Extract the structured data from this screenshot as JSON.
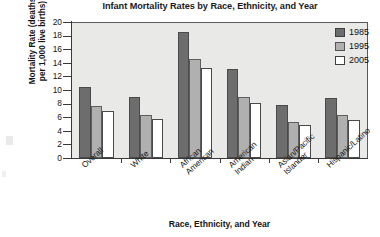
{
  "chart_data": {
    "type": "bar",
    "title": "Infant Mortality Rates by Race, Ethnicity, and Year",
    "xlabel": "Race, Ethnicity, and Year",
    "ylabel": "Mortality Rate (deaths\nper 1,000 live births)",
    "categories": [
      "Overall",
      "White",
      "African\nAmerican",
      "American\nIndian",
      "Asian/Pacific\nIslander",
      "Hispanic/Latino"
    ],
    "series": [
      {
        "name": "1985",
        "color": "#6d6d6d",
        "values": [
          10.4,
          8.9,
          18.6,
          13.1,
          7.8,
          8.8
        ]
      },
      {
        "name": "1995",
        "color": "#b0b0b0",
        "values": [
          7.6,
          6.3,
          14.6,
          9.0,
          5.3,
          6.3
        ]
      },
      {
        "name": "2005",
        "color": "#ffffff",
        "values": [
          6.9,
          5.7,
          13.3,
          8.1,
          4.9,
          5.6
        ]
      }
    ],
    "ylim": [
      0,
      20
    ],
    "yticks": [
      0,
      2,
      4,
      6,
      8,
      10,
      12,
      14,
      16,
      18,
      20
    ],
    "ytick_labels": [
      "0",
      "2",
      "4",
      "6",
      "8",
      "10",
      "12",
      "14",
      "16",
      "18",
      "20"
    ],
    "grid": false,
    "legend_position": "top-right",
    "legend_entries": [
      "1985",
      "1995",
      "2005"
    ],
    "plot_background": "#e9e9e7",
    "axis_color": "#3a3a3a"
  }
}
